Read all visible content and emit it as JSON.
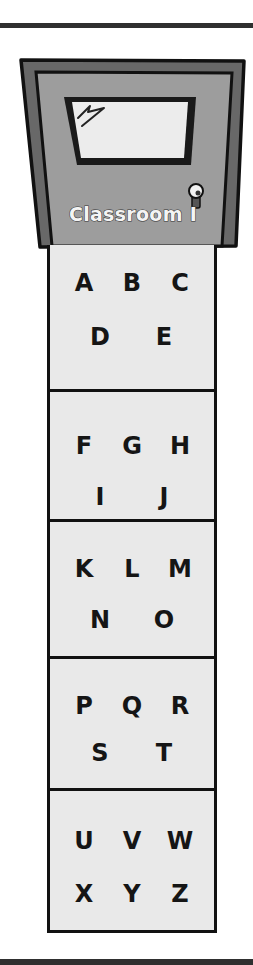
{
  "door": {
    "label": "Classroom I",
    "colors": {
      "frame": "#666666",
      "panel": "#9c9c9c",
      "window": "#ececec",
      "outline": "#111111"
    }
  },
  "sections": [
    {
      "rows": [
        [
          "A",
          "B",
          "C"
        ],
        [
          "D",
          "E"
        ]
      ]
    },
    {
      "rows": [
        [
          "F",
          "G",
          "H"
        ],
        [
          "I",
          "J"
        ]
      ]
    },
    {
      "rows": [
        [
          "K",
          "L",
          "M"
        ],
        [
          "N",
          "O"
        ]
      ]
    },
    {
      "rows": [
        [
          "P",
          "Q",
          "R"
        ],
        [
          "S",
          "T"
        ]
      ]
    },
    {
      "rows": [
        [
          "U",
          "V",
          "W"
        ],
        [
          "X",
          "Y",
          "Z"
        ]
      ]
    }
  ]
}
